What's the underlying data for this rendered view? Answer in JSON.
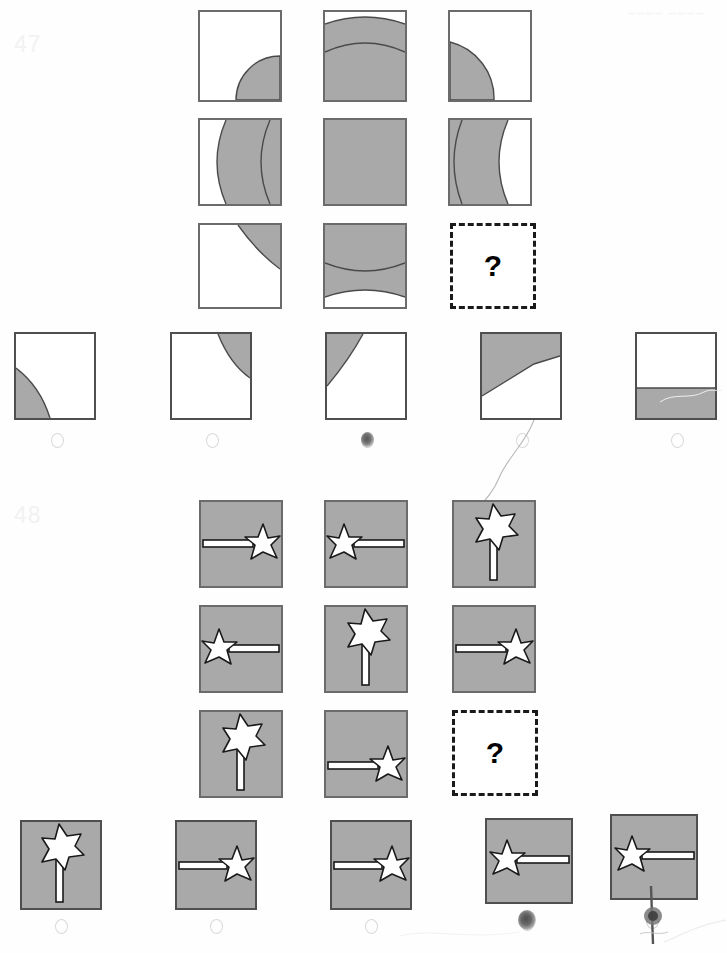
{
  "page": {
    "width": 727,
    "height": 953,
    "background_color": "#fefefe",
    "ink_color": "#000000",
    "shape_fill_gray": "#a9a9a9",
    "shape_outline_gray": "#6b6b6b",
    "bubble_outline_color": "#d9d9d9",
    "question_number_color": "#f2f2f2"
  },
  "puzzles": [
    {
      "id": "puzzle-47",
      "number": "47",
      "type": "matrix-reasoning-3x3",
      "missing_cell_label": "?",
      "matrix": {
        "rows": 3,
        "cols": 3,
        "cells": [
          {
            "row": 1,
            "col": 1,
            "description": "white square with shaded quarter-circle arc in lower-right corner"
          },
          {
            "row": 1,
            "col": 2,
            "description": "shaded square with white arc band across the top and an inner arc line"
          },
          {
            "row": 1,
            "col": 3,
            "description": "white square with shaded quarter-circle arc at the left, upper-middle"
          },
          {
            "row": 2,
            "col": 1,
            "description": "white square with wide vertical shaded crescent band on the right two-thirds"
          },
          {
            "row": 2,
            "col": 2,
            "description": "fully shaded square"
          },
          {
            "row": 2,
            "col": 3,
            "description": "shaded square with vertical arc bands, white region on the right"
          },
          {
            "row": 3,
            "col": 1,
            "description": "white square with small shaded arc sliver in the upper-right corner"
          },
          {
            "row": 3,
            "col": 2,
            "description": "shaded square with two horizontal arc lines and a white band at the bottom"
          },
          {
            "row": 3,
            "col": 3,
            "description": "missing cell - question mark"
          }
        ]
      },
      "options": [
        {
          "index": 1,
          "label": "A",
          "description": "white square with shaded arc sliver in lower-left corner",
          "bubble_marked": false
        },
        {
          "index": 2,
          "label": "B",
          "description": "white square with shaded arc sliver in upper-right corner",
          "bubble_marked": false
        },
        {
          "index": 3,
          "label": "C",
          "description": "white square with shaded arc sliver in upper-left corner",
          "bubble_marked": true
        },
        {
          "index": 4,
          "label": "D",
          "description": "white square with shaded angular region in upper-left",
          "bubble_marked": false
        },
        {
          "index": 5,
          "label": "E",
          "description": "white square with shaded horizontal band across the bottom third",
          "bubble_marked": false
        }
      ]
    },
    {
      "id": "puzzle-48",
      "number": "48",
      "type": "matrix-reasoning-3x3",
      "missing_cell_label": "?",
      "matrix": {
        "rows": 3,
        "cols": 3,
        "cells": [
          {
            "row": 1,
            "col": 1,
            "description": "magic wand pointing right, star on right side, middle height"
          },
          {
            "row": 1,
            "col": 2,
            "description": "magic wand pointing left, star on left side, middle height"
          },
          {
            "row": 1,
            "col": 3,
            "description": "magic wand pointing up, star at top"
          },
          {
            "row": 2,
            "col": 1,
            "description": "magic wand pointing left, star on left side"
          },
          {
            "row": 2,
            "col": 2,
            "description": "magic wand pointing up, star at top"
          },
          {
            "row": 2,
            "col": 3,
            "description": "magic wand pointing right, star on right side"
          },
          {
            "row": 3,
            "col": 1,
            "description": "magic wand pointing up, star at top"
          },
          {
            "row": 3,
            "col": 2,
            "description": "magic wand pointing right, star on right side, lower height"
          },
          {
            "row": 3,
            "col": 3,
            "description": "missing cell - question mark"
          }
        ]
      },
      "options": [
        {
          "index": 1,
          "label": "A",
          "description": "magic wand pointing up, star at top",
          "bubble_marked": false
        },
        {
          "index": 2,
          "label": "B",
          "description": "magic wand pointing right, star on right side",
          "bubble_marked": false
        },
        {
          "index": 3,
          "label": "C",
          "description": "magic wand pointing right, star on right side",
          "bubble_marked": false
        },
        {
          "index": 4,
          "label": "D",
          "description": "magic wand pointing left, star on left side",
          "bubble_marked": true
        },
        {
          "index": 5,
          "label": "E",
          "description": "magic wand pointing left, star on left side",
          "bubble_marked": true
        }
      ]
    }
  ],
  "artifacts": {
    "hairline_curve": "thin curved scan artifact descending from the puzzle 47 answer row into puzzle 48",
    "top_right_smudge": "faint gray marks near the top-right edge of the page",
    "bubble_smudges": "dark ink blots over option bubbles 47-C, 48-D and 48-E"
  }
}
